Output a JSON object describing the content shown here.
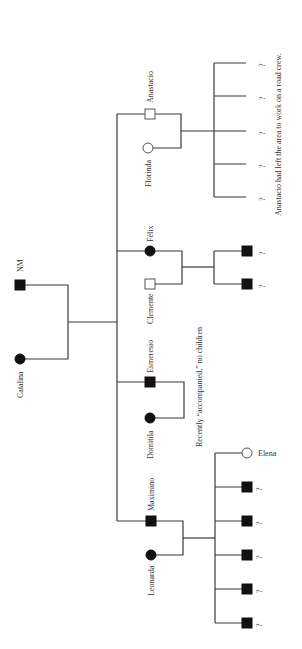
{
  "diagram": {
    "type": "kinship-chart",
    "orientation": "rotated-90-ccw",
    "colors": {
      "line": "#3a3a3a",
      "filled": "#111111",
      "open_stroke": "#555555",
      "text": "#333333"
    },
    "generation1": {
      "father": {
        "name": "NM",
        "symbol": "square",
        "filled": true
      },
      "mother": {
        "name": "Catalina",
        "symbol": "circle",
        "filled": true
      }
    },
    "families": [
      {
        "id": "anastacio",
        "sibling": {
          "name": "Anastacio",
          "symbol": "square",
          "filled": false
        },
        "spouse": {
          "name": "Florinda",
          "symbol": "circle",
          "filled": false
        },
        "children": [
          {
            "label": "?",
            "symbol": "none"
          },
          {
            "label": "?",
            "symbol": "none"
          },
          {
            "label": "?",
            "symbol": "none"
          },
          {
            "label": "?",
            "symbol": "none"
          },
          {
            "label": "?",
            "symbol": "none"
          }
        ],
        "note": "Anastacio had left the area to work on a road crew."
      },
      {
        "id": "felix",
        "sibling": {
          "name": "Félix",
          "symbol": "circle",
          "filled": true
        },
        "spouse": {
          "name": "Clemente",
          "symbol": "square",
          "filled": false
        },
        "children": [
          {
            "label": "?",
            "symbol": "square",
            "filled": true
          },
          {
            "label": "?",
            "symbol": "square",
            "filled": true
          }
        ]
      },
      {
        "id": "esmeresio",
        "sibling": {
          "name": "Esmeresio",
          "symbol": "square",
          "filled": true
        },
        "spouse": {
          "name": "Domitila",
          "symbol": "circle",
          "filled": true
        },
        "children": [],
        "note": "Recently “accompanied,” no children"
      },
      {
        "id": "maximino",
        "sibling": {
          "name": "Maximino",
          "symbol": "square",
          "filled": true
        },
        "spouse": {
          "name": "Leonarda",
          "symbol": "circle",
          "filled": true
        },
        "children": [
          {
            "label": "Elena",
            "symbol": "circle",
            "filled": false
          },
          {
            "label": "?",
            "symbol": "square",
            "filled": true
          },
          {
            "label": "?",
            "symbol": "square",
            "filled": true
          },
          {
            "label": "?",
            "symbol": "square",
            "filled": true
          },
          {
            "label": "?",
            "symbol": "square",
            "filled": true
          },
          {
            "label": "?",
            "symbol": "square",
            "filled": true
          }
        ]
      }
    ]
  }
}
